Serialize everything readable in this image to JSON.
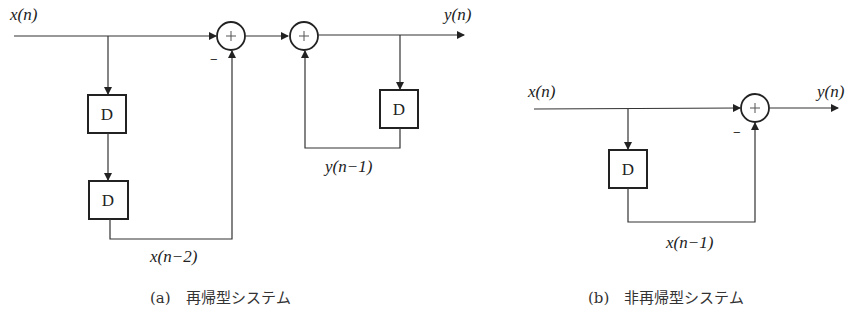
{
  "panel_a": {
    "caption": "(a)　再帰型システム",
    "input_label": "x(n)",
    "output_label": "y(n)",
    "delay_label_1": "D",
    "delay_label_2": "D",
    "delay_label_fb": "D",
    "sum_symbol": "+",
    "minus_sign": "−",
    "tap_label": "x(n−2)",
    "feedback_label": "y(n−1)"
  },
  "panel_b": {
    "caption": "(b)　非再帰型システム",
    "input_label": "x(n)",
    "output_label": "y(n)",
    "delay_label": "D",
    "sum_symbol": "+",
    "minus_sign": "−",
    "tap_label": "x(n−1)"
  }
}
